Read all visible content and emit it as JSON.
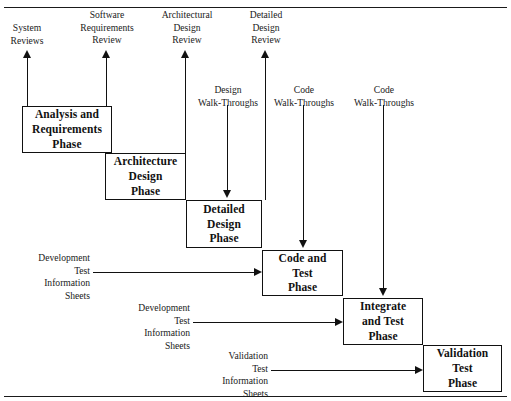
{
  "figure": {
    "frame_color": "#1a1a1a",
    "line_color": "#111111",
    "background": "#ffffff"
  },
  "phases": [
    {
      "id": "analysis-and-requirements-phase",
      "label": "Analysis and\nRequirements\nPhase",
      "lines": [
        "Analysis and",
        "Requirements",
        "Phase"
      ]
    },
    {
      "id": "architecture-design-phase",
      "label": "Architecture\nDesign\nPhase",
      "lines": [
        "Architecture",
        "Design",
        "Phase"
      ]
    },
    {
      "id": "detailed-design-phase",
      "label": "Detailed\nDesign\nPhase",
      "lines": [
        "Detailed",
        "Design",
        "Phase"
      ]
    },
    {
      "id": "code-and-test-phase",
      "label": "Code and\nTest\nPhase",
      "lines": [
        "Code and",
        "Test",
        "Phase"
      ]
    },
    {
      "id": "integrate-and-test-phase",
      "label": "Integrate\nand Test\nPhase",
      "lines": [
        "Integrate",
        "and Test",
        "Phase"
      ]
    },
    {
      "id": "validation-test-phase",
      "label": "Validation\nTest\nPhase",
      "lines": [
        "Validation",
        "Test",
        "Phase"
      ]
    }
  ],
  "review_arrows": [
    {
      "id": "system-reviews",
      "lines": [
        "System",
        "Reviews"
      ]
    },
    {
      "id": "software-requirements-review",
      "lines": [
        "Software",
        "Requirements",
        "Review"
      ]
    },
    {
      "id": "architectural-design-review",
      "lines": [
        "Architectural",
        "Design",
        "Review"
      ]
    },
    {
      "id": "detailed-design-review",
      "lines": [
        "Detailed",
        "Design",
        "Review"
      ]
    }
  ],
  "walkthrough_arrows": [
    {
      "id": "design-walk-throughs",
      "lines": [
        "Design",
        "Walk-Throughs"
      ]
    },
    {
      "id": "code-walk-throughs-1",
      "lines": [
        "Code",
        "Walk-Throughs"
      ]
    },
    {
      "id": "code-walk-throughs-2",
      "lines": [
        "Code",
        "Walk-Throughs"
      ]
    }
  ],
  "information_sheet_arrows": [
    {
      "id": "development-test-information-sheets-1",
      "lines": [
        "Development",
        "Test",
        "Information",
        "Sheets"
      ]
    },
    {
      "id": "development-test-information-sheets-2",
      "lines": [
        "Development",
        "Test",
        "Information",
        "Sheets"
      ]
    },
    {
      "id": "validation-test-information-sheets",
      "lines": [
        "Validation",
        "Test",
        "Information",
        "Sheets"
      ]
    }
  ]
}
